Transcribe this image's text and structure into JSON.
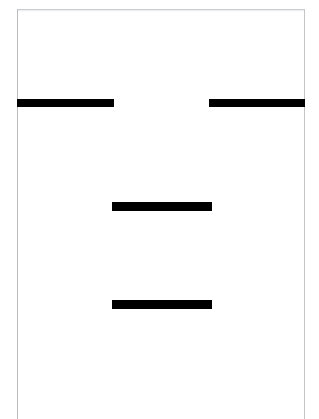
{
  "document": {
    "page_background_color": "#ffffff",
    "page_border_color": "#b9bcc0",
    "redaction_color": "#000000",
    "page_label": "",
    "visible_text": ""
  },
  "redactions": [
    {
      "id": "redaction-1",
      "label": "",
      "x": 17,
      "y": 99,
      "width": 97,
      "height": 8,
      "row": 1,
      "position": "left"
    },
    {
      "id": "redaction-2",
      "label": "",
      "x": 209,
      "y": 99,
      "width": 96,
      "height": 8,
      "row": 1,
      "position": "right"
    },
    {
      "id": "redaction-3",
      "label": "",
      "x": 112,
      "y": 202,
      "width": 100,
      "height": 9,
      "row": 2,
      "position": "center"
    },
    {
      "id": "redaction-4",
      "label": "",
      "x": 112,
      "y": 300,
      "width": 100,
      "height": 9,
      "row": 3,
      "position": "center"
    }
  ]
}
